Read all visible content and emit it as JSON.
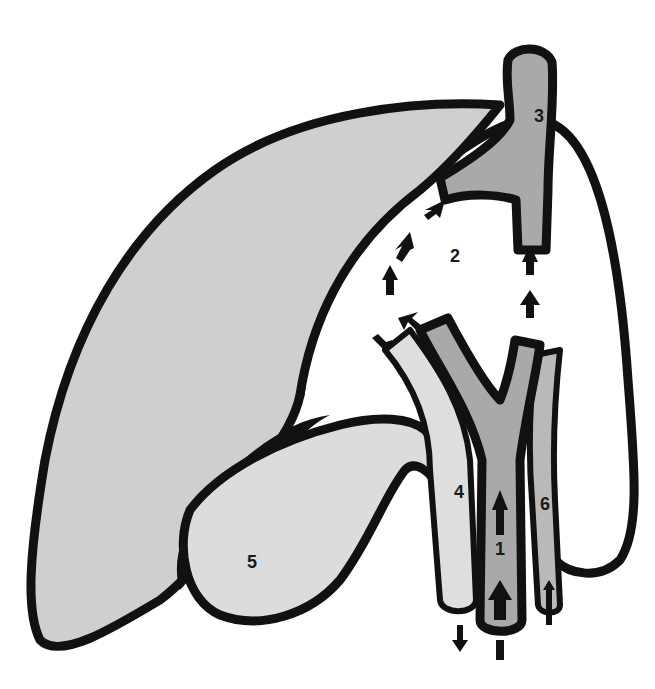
{
  "diagram": {
    "type": "anatomical-illustration",
    "colors": {
      "background": "#ffffff",
      "outline": "#111111",
      "liver_lobe_fill": "#cfcfcf",
      "vein_fill": "#a9a9a9",
      "duct_fill": "#dedede",
      "gallbladder_fill": "#dcdcdc",
      "artery_fill": "#b9b9b9",
      "arrow": "#111111"
    },
    "labels": [
      {
        "id": "1",
        "text": "1",
        "x": 500,
        "y": 555
      },
      {
        "id": "2",
        "text": "2",
        "x": 455,
        "y": 262
      },
      {
        "id": "3",
        "text": "3",
        "x": 539,
        "y": 122
      },
      {
        "id": "4",
        "text": "4",
        "x": 459,
        "y": 498
      },
      {
        "id": "5",
        "text": "5",
        "x": 252,
        "y": 568
      },
      {
        "id": "6",
        "text": "6",
        "x": 545,
        "y": 510
      }
    ]
  }
}
